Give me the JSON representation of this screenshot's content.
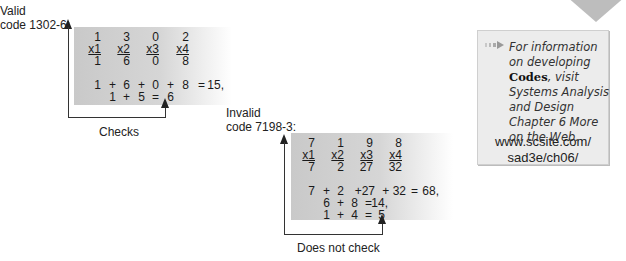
{
  "valid": {
    "label_line1": "Valid",
    "label_line2": "code 1302-6:",
    "digits": [
      "1",
      "3",
      "0",
      "2"
    ],
    "weights": [
      "x1",
      "x2",
      "x3",
      "x4"
    ],
    "products": [
      "1",
      "6",
      "0",
      "8"
    ],
    "sum_line": [
      "1",
      "+",
      "6",
      "+",
      "0",
      "+",
      "8",
      "=",
      "15,"
    ],
    "check_line": [
      "1",
      "+",
      "5",
      "=",
      "6"
    ],
    "result_label": "Checks"
  },
  "invalid": {
    "label_line1": "Invalid",
    "label_line2": "code 7198-3:",
    "digits": [
      "7",
      "1",
      "9",
      "8"
    ],
    "weights": [
      "x1",
      "x2",
      "x3",
      "x4"
    ],
    "products": [
      "7",
      "2",
      "27",
      "32"
    ],
    "sum_line": [
      "7",
      "+",
      "2",
      "+27",
      "+ 32",
      "=",
      "68,"
    ],
    "second_line": [
      "6",
      "+",
      "8",
      "=",
      "14,"
    ],
    "check_line": [
      "1",
      "+",
      "4",
      "=",
      "5"
    ],
    "result_label": "Does not check"
  },
  "info": {
    "text_before": "For information on developing ",
    "text_bold": "Codes",
    "text_after": ", visit Systems Analysis and Design Chapter 6 More on the Web.",
    "url_line1": "www.scsite.com/",
    "url_line2": "sad3e/ch06/",
    "icon": "arrow-bullet-icon"
  }
}
